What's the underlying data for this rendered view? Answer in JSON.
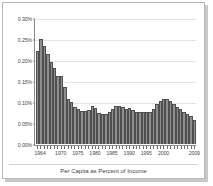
{
  "figure": {
    "caption": "Per Capita as Percent of Income"
  },
  "chart_data": {
    "type": "bar",
    "title": "",
    "subtitle": "",
    "xlabel": "",
    "ylabel": "",
    "ylim": [
      0.0,
      0.3
    ],
    "ytick_labels": [
      "0.30%",
      "0.25%",
      "0.20%",
      "0.15%",
      "0.10%",
      "0.05%",
      "0.00%"
    ],
    "ytick_values": [
      0.3,
      0.25,
      0.2,
      0.15,
      0.1,
      0.05,
      0.0
    ],
    "xtick_labels": [
      "1964",
      "1970",
      "1975",
      "1980",
      "1985",
      "1990",
      "1995",
      "2000",
      "2009"
    ],
    "xtick_years": [
      1964,
      1970,
      1975,
      1980,
      1985,
      1990,
      1995,
      2000,
      2009
    ],
    "grid": true,
    "legend": "none",
    "unit": "percent",
    "bar_color": "#8e8e8e",
    "bar_edge_color": "#4f4f4f",
    "gridline_color": "#e4e4e4",
    "axis_color": "#8a8a8a",
    "categories": [
      1963,
      1964,
      1965,
      1966,
      1967,
      1968,
      1969,
      1970,
      1971,
      1972,
      1973,
      1974,
      1975,
      1976,
      1977,
      1978,
      1979,
      1980,
      1981,
      1982,
      1983,
      1984,
      1985,
      1986,
      1987,
      1988,
      1989,
      1990,
      1991,
      1992,
      1993,
      1994,
      1995,
      1996,
      1997,
      1998,
      1999,
      2000,
      2001,
      2002,
      2003,
      2004,
      2005,
      2006,
      2007,
      2008,
      2009
    ],
    "values": [
      0.224,
      0.252,
      0.236,
      0.216,
      0.196,
      0.182,
      0.163,
      0.163,
      0.136,
      0.108,
      0.1,
      0.088,
      0.085,
      0.079,
      0.079,
      0.082,
      0.092,
      0.086,
      0.075,
      0.071,
      0.073,
      0.078,
      0.084,
      0.091,
      0.092,
      0.088,
      0.085,
      0.087,
      0.082,
      0.076,
      0.076,
      0.077,
      0.078,
      0.077,
      0.083,
      0.096,
      0.104,
      0.107,
      0.108,
      0.103,
      0.096,
      0.09,
      0.085,
      0.078,
      0.072,
      0.067,
      0.057
    ]
  }
}
